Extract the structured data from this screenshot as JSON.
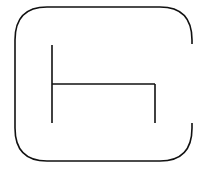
{
  "icon": {
    "name": "open-box-with-bracket-glyph",
    "stroke_color": "#111111",
    "background_color": "#ffffff",
    "stroke_width": 1.6
  }
}
